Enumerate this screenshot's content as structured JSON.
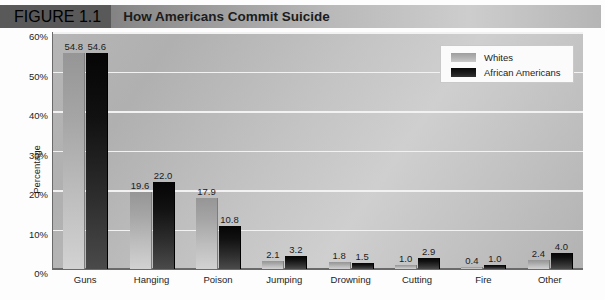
{
  "figure": {
    "number_label": "FIGURE 1.1",
    "title": "How Americans Commit Suicide"
  },
  "legend": {
    "items": [
      {
        "label": "Whites",
        "swatch": "light-gray-gradient-swatch"
      },
      {
        "label": "African Americans",
        "swatch": "black-gradient-swatch"
      }
    ]
  },
  "chart_data": {
    "type": "bar",
    "title": "How Americans Commit Suicide",
    "xlabel": "",
    "ylabel": "Percentage",
    "ylim": [
      0,
      60
    ],
    "yticks": [
      0,
      10,
      20,
      30,
      40,
      50,
      60
    ],
    "ytick_labels": [
      "0%",
      "10%",
      "20%",
      "30%",
      "40%",
      "50%",
      "60%"
    ],
    "grid": true,
    "legend_position": "top-right",
    "categories": [
      "Guns",
      "Hanging",
      "Poison",
      "Jumping",
      "Drowning",
      "Cutting",
      "Fire",
      "Other"
    ],
    "series": [
      {
        "name": "Whites",
        "color": "#b4b4b4",
        "values": [
          54.8,
          19.6,
          17.9,
          2.1,
          1.8,
          1.0,
          0.4,
          2.4
        ],
        "labels": [
          "54.8",
          "19.6",
          "17.9",
          "2.1",
          "1.8",
          "1.0",
          "0.4",
          "2.4"
        ]
      },
      {
        "name": "African Americans",
        "color": "#111111",
        "values": [
          54.6,
          22.0,
          10.8,
          3.2,
          1.5,
          2.9,
          1.0,
          4.0
        ],
        "labels": [
          "54.6",
          "22.0",
          "10.8",
          "3.2",
          "1.5",
          "2.9",
          "1.0",
          "4.0"
        ]
      }
    ]
  }
}
